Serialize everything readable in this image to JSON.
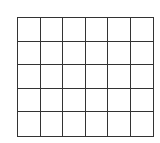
{
  "grid": {
    "rows": 5,
    "columns": 6,
    "line_color": "#333333",
    "cell_fill": "#ffffff",
    "cells": [
      [
        "",
        "",
        "",
        "",
        "",
        ""
      ],
      [
        "",
        "",
        "",
        "",
        "",
        ""
      ],
      [
        "",
        "",
        "",
        "",
        "",
        ""
      ],
      [
        "",
        "",
        "",
        "",
        "",
        ""
      ],
      [
        "",
        "",
        "",
        "",
        "",
        ""
      ]
    ]
  }
}
